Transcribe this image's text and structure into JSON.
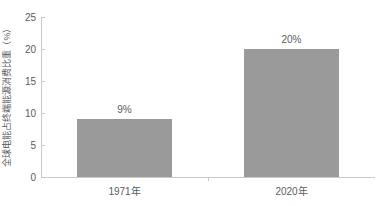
{
  "chart_data": {
    "type": "bar",
    "title": "",
    "subtitle": "",
    "xlabel": "",
    "ylabel": "全球电能占终端能源消费比重（%）",
    "categories": [
      "1971年",
      "2020年"
    ],
    "values": [
      9,
      20
    ],
    "data_labels": [
      "9%",
      "20%"
    ],
    "ylim": [
      0,
      25
    ],
    "y_ticks": [
      0,
      5,
      10,
      15,
      20,
      25
    ],
    "y_tick_labels": [
      "0",
      "5",
      "10",
      "15",
      "20",
      "25"
    ],
    "grid": false,
    "legend": null,
    "legend_position": "none",
    "annotations": [],
    "colors": {
      "bar": "#9a9a9a",
      "text": "#5b5b5b",
      "axis": "#c9c9c9",
      "background": "#ffffff"
    }
  }
}
